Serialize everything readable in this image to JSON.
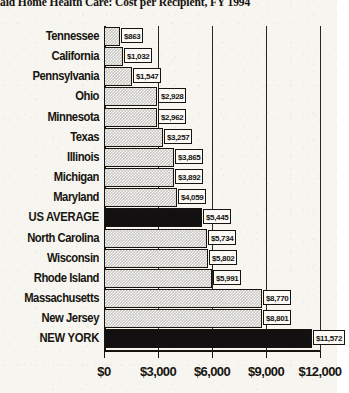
{
  "chart_data": {
    "type": "bar",
    "orientation": "horizontal",
    "title": "aid Home Health Care: Cost per Recipient, FY 1994",
    "xlabel": "",
    "ylabel": "",
    "xlim": [
      0,
      12000
    ],
    "grid": true,
    "legend": null,
    "xticks": [
      "$0",
      "$3,000",
      "$6,000",
      "$9,000",
      "$12,000"
    ],
    "xtick_values": [
      0,
      3000,
      6000,
      9000,
      12000
    ],
    "categories": [
      "Tennessee",
      "California",
      "Pennsylvania",
      "Ohio",
      "Minnesota",
      "Texas",
      "Illinois",
      "Michigan",
      "Maryland",
      "US AVERAGE",
      "North Carolina",
      "Wisconsin",
      "Rhode Island",
      "Massachusetts",
      "New Jersey",
      "NEW YORK"
    ],
    "values": [
      863,
      1032,
      1547,
      2928,
      2962,
      3257,
      3865,
      3892,
      4059,
      5445,
      5734,
      5802,
      5991,
      8770,
      8801,
      11572
    ],
    "data_labels": [
      "$863",
      "$1,032",
      "$1,547",
      "$2,928",
      "$2,962",
      "$3,257",
      "$3,865",
      "$3,892",
      "$4,059",
      "$5,445",
      "$5,734",
      "$5,802",
      "$5,991",
      "$8,770",
      "$8,801",
      "$11,572"
    ],
    "highlighted": [
      "US AVERAGE",
      "NEW YORK"
    ],
    "colors": {
      "bar_fill": "#c9c7c2",
      "bar_highlight_fill": "#121010",
      "bar_outline": "#17140f",
      "background": "#f6f5f0",
      "text": "#17140f"
    }
  }
}
